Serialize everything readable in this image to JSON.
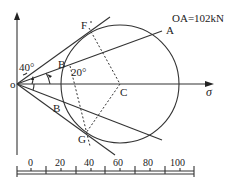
{
  "diagram": {
    "annotation": "OA=102kN",
    "axis_label": "σ",
    "points": {
      "origin": "o",
      "F": "F",
      "A": "A",
      "B_upper": "B",
      "B_lower": "B",
      "C": "C",
      "G": "G"
    },
    "angles": {
      "angle_1": "40°",
      "angle_2": "20°"
    },
    "scale": {
      "ticks": [
        "0",
        "20",
        "40",
        "60",
        "80",
        "100"
      ]
    }
  }
}
